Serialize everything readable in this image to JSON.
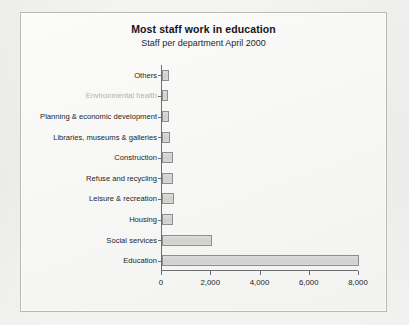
{
  "chart_data": {
    "type": "bar",
    "orientation": "horizontal",
    "title": "Most staff work in education",
    "subtitle": "Staff per department April 2000",
    "xlabel": "",
    "ylabel": "",
    "xlim": [
      0,
      8000
    ],
    "xticks": [
      0,
      2000,
      4000,
      6000,
      8000
    ],
    "xticklabels": [
      "0",
      "2,000",
      "4,000",
      "6,000",
      "8,000"
    ],
    "grid": false,
    "legend": null,
    "categories": [
      "Others",
      "Environmental health",
      "Planning & economic development",
      "Libraries, museums & galleries",
      "Construction",
      "Refuse and recycling",
      "Leisure & recreation",
      "Housing",
      "Social services",
      "Education"
    ],
    "values": [
      300,
      260,
      280,
      330,
      460,
      430,
      480,
      450,
      2050,
      8050
    ],
    "bar_fill": "#d4d4d2",
    "bar_border": "#8e8e90",
    "axis_color": "#6e6e70",
    "note": "Second category label is heavily faded/illegible in the scan"
  },
  "labels": {
    "faded_index": 1
  }
}
